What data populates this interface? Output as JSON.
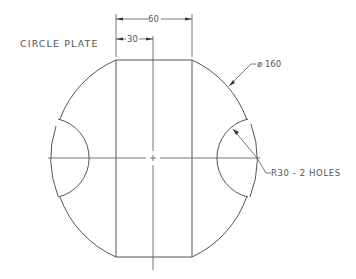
{
  "drawing": {
    "title": "CIRCLE PLATE",
    "dimensions": {
      "overall_width": "60",
      "half_width": "30",
      "diameter": "ø 160",
      "hole_note": "R30 - 2 HOLES"
    },
    "colors": {
      "line": "#555555",
      "background": "#ffffff"
    }
  }
}
